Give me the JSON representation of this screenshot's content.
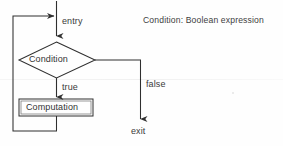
{
  "diagram": {
    "title_caption": "Condition: Boolean expression",
    "nodes": {
      "decision": {
        "label": "Condition",
        "shape": "diamond",
        "x": 20,
        "y": 42,
        "width": 75,
        "height": 36
      },
      "process": {
        "label": "Computation",
        "shape": "rectangle-double-border",
        "x": 19,
        "y": 99,
        "width": 74,
        "height": 17
      }
    },
    "edge_labels": {
      "entry": "entry",
      "true": "true",
      "false": "false",
      "exit": "exit"
    },
    "colors": {
      "line": "#2f2f2f",
      "text": "#333333",
      "background": "#fefefe"
    }
  }
}
